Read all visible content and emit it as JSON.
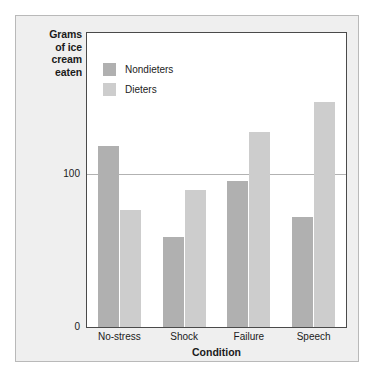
{
  "chart_data": {
    "type": "bar",
    "title": "",
    "xlabel": "Condition",
    "ylabel": "Grams of ice cream eaten",
    "categories": [
      "No-stress",
      "Shock",
      "Failure",
      "Speech"
    ],
    "series": [
      {
        "name": "Nondieters",
        "color": "#b0b0b0",
        "values": [
          119,
          59,
          96,
          72
        ]
      },
      {
        "name": "Dieters",
        "color": "#cdcdcd",
        "values": [
          77,
          90,
          128,
          148
        ]
      }
    ],
    "ylim": [
      0,
      193
    ],
    "yticks": [
      0,
      100
    ],
    "ytick_labels": [
      "0",
      "100"
    ],
    "gridlines": [
      100
    ],
    "grid": true,
    "legend_position": "top-left-inside"
  },
  "axis": {
    "y_title_lines": [
      "Grams",
      "of ice",
      "cream",
      "eaten"
    ],
    "y_title_text": "Grams of ice cream eaten",
    "x_title": "Condition",
    "y_tick_0": "0",
    "y_tick_100": "100"
  },
  "legend": {
    "items": [
      {
        "label": "Nondieters",
        "color": "#b0b0b0"
      },
      {
        "label": "Dieters",
        "color": "#cdcdcd"
      }
    ]
  },
  "xticks": [
    {
      "label": "No-stress"
    },
    {
      "label": "Shock"
    },
    {
      "label": "Failure"
    },
    {
      "label": "Speech"
    }
  ],
  "colors": {
    "panel_background": "#efefef",
    "panel_border": "#b9b9b9",
    "plot_background": "#ffffff",
    "plot_border": "#4a4a4a",
    "gridline": "#b2b2b2",
    "nondieters": "#b0b0b0",
    "dieters": "#cdcdcd",
    "text": "#1b1b1b"
  }
}
